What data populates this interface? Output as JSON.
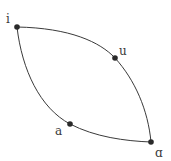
{
  "diagram": {
    "type": "graph",
    "nodes": [
      {
        "id": "i",
        "label": "i",
        "x": 17,
        "y": 27,
        "label_x": 6,
        "label_y": 23
      },
      {
        "id": "u",
        "label": "u",
        "x": 115,
        "y": 58,
        "label_x": 119,
        "label_y": 55
      },
      {
        "id": "a",
        "label": "a",
        "x": 70,
        "y": 124,
        "label_x": 55,
        "label_y": 135
      },
      {
        "id": "alpha",
        "label": "ɑ",
        "x": 151,
        "y": 142,
        "label_x": 155,
        "label_y": 157
      }
    ],
    "edges": [
      {
        "from": "i",
        "to": "alpha",
        "via": "u",
        "name": "upper-arc"
      },
      {
        "from": "i",
        "to": "alpha",
        "via": "a",
        "name": "lower-arc"
      }
    ],
    "colors": {
      "stroke": "#3a3a3a",
      "node": "#2a2a2a",
      "background": "#ffffff"
    }
  }
}
